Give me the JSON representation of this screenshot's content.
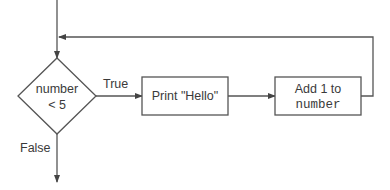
{
  "diagram": {
    "type": "flowchart",
    "colors": {
      "stroke": "#555555",
      "text": "#3a3a3a",
      "background": "#ffffff"
    },
    "decision": {
      "line1": "number",
      "line2": "< 5"
    },
    "edges": {
      "true_label": "True",
      "false_label": "False"
    },
    "process_print": {
      "label": "Print \"Hello\""
    },
    "process_add": {
      "line1": "Add 1 to",
      "line2": "number"
    }
  }
}
